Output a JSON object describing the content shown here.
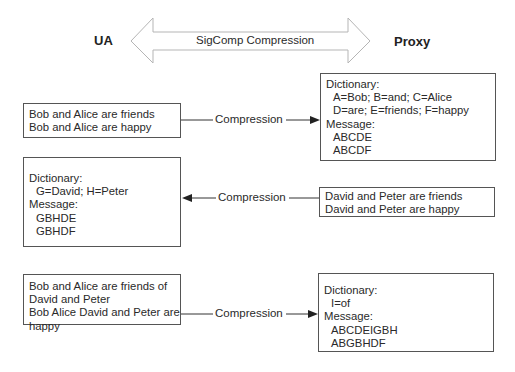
{
  "header": {
    "left_endpoint": "UA",
    "right_endpoint": "Proxy",
    "banner_label": "SigComp Compression"
  },
  "rows": [
    {
      "direction": "ua-to-proxy",
      "connector_label": "Compression",
      "ua_box": {
        "lines": [
          "Bob and Alice are friends",
          "Bob and Alice are happy"
        ]
      },
      "proxy_box": {
        "dictionary_label": "Dictionary:",
        "dictionary_entries": [
          "A=Bob; B=and; C=Alice",
          "D=are; E=friends; F=happy"
        ],
        "message_label": "Message:",
        "message_entries": [
          "ABCDE",
          "ABCDF"
        ]
      }
    },
    {
      "direction": "proxy-to-ua",
      "connector_label": "Compression",
      "ua_box": {
        "dictionary_label": "Dictionary:",
        "dictionary_entries": [
          "G=David; H=Peter"
        ],
        "message_label": "Message:",
        "message_entries": [
          "GBHDE",
          "GBHDF"
        ]
      },
      "proxy_box": {
        "lines": [
          "David and Peter are friends",
          "David and Peter are happy"
        ]
      }
    },
    {
      "direction": "ua-to-proxy",
      "connector_label": "Compression",
      "ua_box": {
        "lines": [
          "Bob and Alice are friends of",
          "David and Peter",
          "Bob Alice David and Peter are",
          "happy"
        ]
      },
      "proxy_box": {
        "dictionary_label": "Dictionary:",
        "dictionary_entries": [
          "I=of"
        ],
        "message_label": "Message:",
        "message_entries": [
          "ABCDEIGBH",
          "ABGBHDF"
        ]
      }
    }
  ],
  "colors": {
    "line": "#333333",
    "box_border": "#555555",
    "banner_outline": "#b5b5b5",
    "text": "#2a2a2a"
  }
}
